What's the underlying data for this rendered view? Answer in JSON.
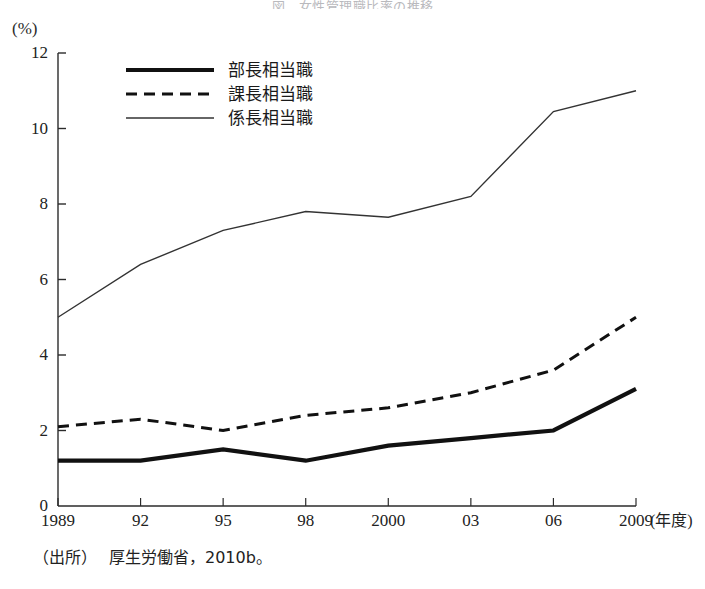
{
  "figure": {
    "title": "図　女性管理職比率の推移",
    "unit_label": "(%)",
    "xaxis_unit": "(年度)",
    "source_label": "（出所）",
    "source_text": "厚生労働省，2010b。"
  },
  "legend": {
    "position": "top-left-inside",
    "items": [
      {
        "label": "部長相当職",
        "style": "thick-solid",
        "color": "#111111",
        "width": 4.2,
        "dash": "none"
      },
      {
        "label": "課長相当職",
        "style": "dashed",
        "color": "#111111",
        "width": 3.0,
        "dash": "11,7"
      },
      {
        "label": "係長相当職",
        "style": "thin-solid",
        "color": "#333333",
        "width": 1.4,
        "dash": "none"
      }
    ]
  },
  "chart_data": {
    "type": "line",
    "title": "図　女性管理職比率の推移",
    "xlabel": "(年度)",
    "ylabel": "(%)",
    "categories": [
      "1989",
      "92",
      "95",
      "98",
      "2000",
      "03",
      "06",
      "2009"
    ],
    "xlim": [
      0,
      7
    ],
    "ylim": [
      0,
      12
    ],
    "yticks": [
      0,
      2,
      4,
      6,
      8,
      10,
      12
    ],
    "grid": false,
    "series": [
      {
        "name": "部長相当職",
        "values": [
          1.2,
          1.2,
          1.5,
          1.2,
          1.6,
          1.8,
          2.0,
          3.1
        ]
      },
      {
        "name": "課長相当職",
        "values": [
          2.1,
          2.3,
          2.0,
          2.4,
          2.6,
          3.0,
          3.6,
          5.0
        ]
      },
      {
        "name": "係長相当職",
        "values": [
          5.0,
          6.4,
          7.3,
          7.8,
          7.65,
          8.2,
          10.45,
          11.0
        ]
      }
    ]
  },
  "axis_geometry": {
    "plot_left": 58,
    "plot_right": 636,
    "plot_top": 53,
    "plot_bottom": 506
  }
}
